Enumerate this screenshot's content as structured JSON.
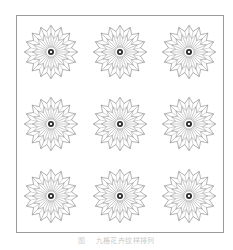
{
  "figure": {
    "name": "rosette-pattern-plate",
    "background_color": "#ffffff",
    "border_color": "#9a9a9a",
    "stroke_color": "#6e6e6e",
    "hub_color": "#2b2b2b",
    "grid": {
      "rows": 3,
      "columns": 3,
      "total_motifs": 9
    },
    "motif": {
      "name": "rosette",
      "petal_count": 16,
      "spoke_count": 16,
      "hub_style": "dark-ring-with-light-center",
      "outline_style": "star-polygon"
    }
  },
  "caption": {
    "label": "图",
    "text": "九格花卉纹样排列"
  },
  "cells": [
    {
      "id": "rosette-r1c1",
      "row": 1,
      "column": 1
    },
    {
      "id": "rosette-r1c2",
      "row": 1,
      "column": 2
    },
    {
      "id": "rosette-r1c3",
      "row": 1,
      "column": 3
    },
    {
      "id": "rosette-r2c1",
      "row": 2,
      "column": 1
    },
    {
      "id": "rosette-r2c2",
      "row": 2,
      "column": 2
    },
    {
      "id": "rosette-r2c3",
      "row": 2,
      "column": 3
    },
    {
      "id": "rosette-r3c1",
      "row": 3,
      "column": 1
    },
    {
      "id": "rosette-r3c2",
      "row": 3,
      "column": 2
    },
    {
      "id": "rosette-r3c3",
      "row": 3,
      "column": 3
    }
  ]
}
